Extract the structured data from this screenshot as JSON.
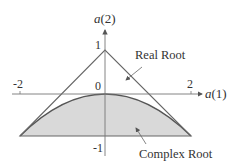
{
  "diagram": {
    "type": "stability-triangle",
    "axes": {
      "x_label": "a(1)",
      "y_label": "a(2)",
      "x_ticks": [
        "-2",
        "2"
      ],
      "y_ticks": [
        "1",
        "0",
        "-1"
      ],
      "x_range": [
        -2,
        2
      ],
      "y_range": [
        -1,
        1
      ]
    },
    "regions": [
      {
        "name": "Real Root",
        "label": "Real Root",
        "shaded": false
      },
      {
        "name": "Complex Root",
        "label": "Complex Root",
        "shaded": true
      }
    ],
    "colors": {
      "line": "#555555",
      "shade": "#d9d9d9",
      "text": "#333333"
    }
  }
}
